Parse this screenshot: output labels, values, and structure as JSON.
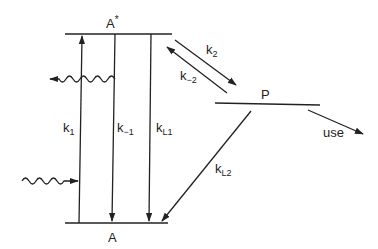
{
  "diagram": {
    "type": "energy-level-kinetic-scheme",
    "levels": {
      "excited": {
        "label": "A",
        "superscript": "*"
      },
      "ground": {
        "label": "A"
      },
      "product": {
        "label": "P"
      }
    },
    "rates": {
      "k1": {
        "base": "k",
        "sub": "1"
      },
      "k_minus1": {
        "base": "k",
        "sub": "−1"
      },
      "kL1": {
        "base": "k",
        "sub": "L1"
      },
      "k2": {
        "base": "k",
        "sub": "2"
      },
      "k_minus2": {
        "base": "k",
        "sub": "−2"
      },
      "kL2": {
        "base": "k",
        "sub": "L2"
      }
    },
    "use_label": "use"
  }
}
